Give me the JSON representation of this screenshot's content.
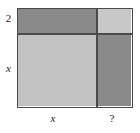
{
  "figure": {
    "name": "area-model-rectangle",
    "border_color": "#4a4a4a",
    "background_color": "#ffffff",
    "text_color": "#1a1a1a"
  },
  "tiles": [
    {
      "id": "top-left",
      "name": "tile-top-left",
      "fill": "#8a8a8a",
      "shade": "medium-gray",
      "width_label": "x",
      "height_label": "2"
    },
    {
      "id": "top-right",
      "name": "tile-top-right",
      "fill": "#c8c8c8",
      "shade": "light-gray",
      "width_label": "?",
      "height_label": "2"
    },
    {
      "id": "bottom-left",
      "name": "tile-bottom-left",
      "fill": "#c2c2c2",
      "shade": "light-gray",
      "width_label": "x",
      "height_label": "x"
    },
    {
      "id": "bottom-right",
      "name": "tile-bottom-right",
      "fill": "#8a8a8a",
      "shade": "medium-gray",
      "width_label": "?",
      "height_label": "x"
    }
  ],
  "labels": {
    "left_top": "2",
    "left_bottom": "x",
    "bottom_left": "x",
    "bottom_right": "?"
  }
}
